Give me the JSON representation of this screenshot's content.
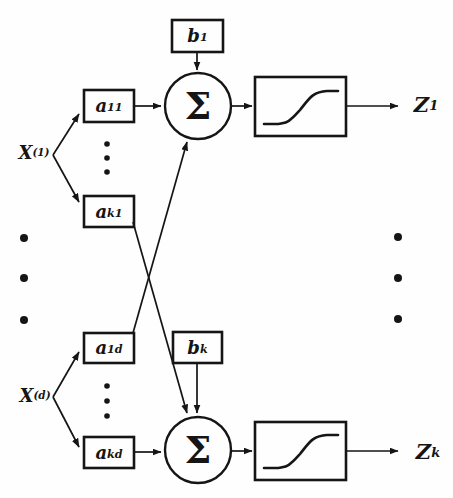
{
  "figure": {
    "type": "neural-network-node-diagram",
    "colors": {
      "ink": "#151515",
      "background": "#fefefe"
    },
    "nodes": {
      "x1": {
        "base": "X",
        "sup": "(1)"
      },
      "xd": {
        "base": "X",
        "sup": "(d)"
      },
      "a11": {
        "base": "a",
        "sub": "11"
      },
      "ak1": {
        "base": "a",
        "sub": "k1"
      },
      "a1d": {
        "base": "a",
        "sub": "1d"
      },
      "akd": {
        "base": "a",
        "sub": "kd"
      },
      "b1": {
        "base": "b",
        "sub": "1"
      },
      "bk": {
        "base": "b",
        "sub": "k"
      },
      "sum1": {
        "symbol": "Σ"
      },
      "sum2": {
        "symbol": "Σ"
      },
      "z1": {
        "base": "Z",
        "sub": "1"
      },
      "zk": {
        "base": "Z",
        "sub": "k"
      }
    },
    "icons": {
      "activation_1": "sigmoid-curve",
      "activation_2": "sigmoid-curve",
      "continuation_marks": "vertical-ellipsis"
    }
  }
}
